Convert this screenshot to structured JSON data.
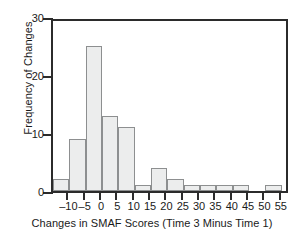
{
  "chart_data": {
    "type": "bar",
    "title": "",
    "xlabel": "Changes in SMAF Scores (Time 3 Minus Time 1)",
    "ylabel": "Frequency of Changes",
    "bin_width": 5,
    "bin_edges": [
      -15,
      -10,
      -5,
      0,
      5,
      10,
      15,
      20,
      25,
      30,
      35,
      40,
      45,
      50,
      55
    ],
    "categories": [
      "-15 to -10",
      "-10 to -5",
      "-5 to 0",
      "0 to 5",
      "5 to 10",
      "10 to 15",
      "15 to 20",
      "20 to 25",
      "25 to 30",
      "30 to 35",
      "35 to 40",
      "40 to 45",
      "45 to 50",
      "50 to 55"
    ],
    "values": [
      2,
      9,
      25,
      13,
      11,
      1,
      4,
      2,
      1,
      1,
      1,
      1,
      0,
      1
    ],
    "xlim": [
      -15,
      57.5
    ],
    "ylim": [
      0,
      30
    ],
    "xticks": [
      -10,
      -5,
      0,
      5,
      10,
      15,
      20,
      25,
      30,
      35,
      40,
      45,
      50,
      55
    ],
    "xtick_labels": [
      "–10",
      "–5",
      "0",
      "5",
      "10",
      "15",
      "20",
      "25",
      "30",
      "35",
      "40",
      "45",
      "50",
      "55"
    ],
    "yticks": [
      0,
      10,
      20,
      30
    ],
    "ytick_labels": [
      "0",
      "10",
      "20",
      "30"
    ],
    "grid": false,
    "legend": false,
    "bar_fill": "#eceded",
    "bar_edge": "#8d8f90",
    "axis_color": "#2b2b2b"
  }
}
